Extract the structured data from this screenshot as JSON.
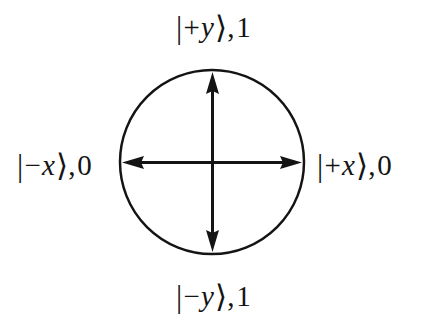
{
  "figure": {
    "name": "qubit-state-circle-diagram",
    "background_color": "#ffffff",
    "stroke_color": "#141414",
    "width": 427,
    "height": 328
  },
  "circle": {
    "center_x": 212,
    "center_y": 162,
    "radius": 92,
    "stroke_width": 2.5
  },
  "axes": {
    "horizontal": {
      "name": "x-axis-double-arrow",
      "from_x": 122,
      "to_x": 302,
      "y": 162
    },
    "vertical": {
      "name": "y-axis-double-arrow",
      "x": 212,
      "from_y": 72,
      "to_y": 252
    },
    "shaft_width": 3,
    "arrowhead_width": 14,
    "arrowhead_length": 22
  },
  "labels": {
    "top": {
      "ket_open": "|",
      "sign": "+",
      "variable": "y",
      "ket_close": "⟩",
      "separator": ",",
      "bit": "1",
      "full_text": "|+y⟩,1"
    },
    "bottom": {
      "ket_open": "|",
      "sign": "−",
      "variable": "y",
      "ket_close": "⟩",
      "separator": ",",
      "bit": "1",
      "full_text": "|−y⟩,1"
    },
    "left": {
      "ket_open": "|",
      "sign": "−",
      "variable": "x",
      "ket_close": "⟩",
      "separator": ",",
      "bit": "0",
      "full_text": "|−x⟩,0"
    },
    "right": {
      "ket_open": "|",
      "sign": "+",
      "variable": "x",
      "ket_close": "⟩",
      "separator": ",",
      "bit": "0",
      "full_text": "|+x⟩,0"
    }
  }
}
